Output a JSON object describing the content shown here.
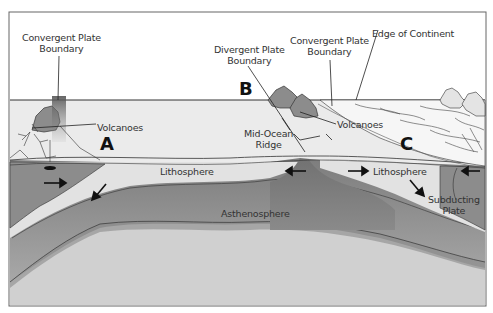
{
  "diagram": {
    "labels": {
      "convergent_left": [
        "Convergent Plate",
        "Boundary"
      ],
      "divergent": [
        "Divergent Plate",
        "Boundary"
      ],
      "convergent_right": [
        "Convergent Plate",
        "Boundary"
      ],
      "edge_of_continent": "Edge of Continent",
      "volcanoes_left": "Volcanoes",
      "volcanoes_right": "Volcanoes",
      "mid_ocean_ridge": [
        "Mid-Ocean",
        "Ridge"
      ],
      "lithosphere_left": "Lithosphere",
      "lithosphere_right": "Lithosphere",
      "asthenosphere": "Asthenosphere",
      "subducting_plate": [
        "Subducting",
        "Plate"
      ]
    },
    "markers": {
      "a": "A",
      "b": "B",
      "c": "C"
    },
    "colors": {
      "ocean_surface": "#e8e8e8",
      "lithosphere": "#e2e2e2",
      "plate_dark": "#8e8e8e",
      "asthenosphere": "#9a9a9a",
      "mantle": "#cfcfcf",
      "volcano": "#8c8c8c",
      "outline": "#222222",
      "frame": "#666666"
    }
  }
}
